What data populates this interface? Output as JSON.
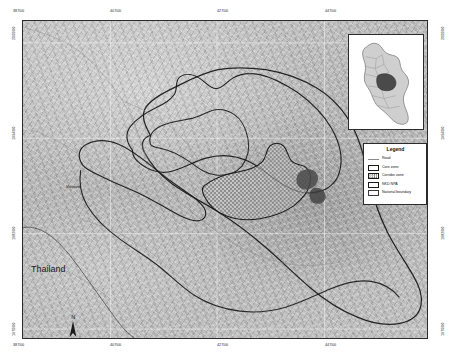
{
  "map": {
    "title": "Nakai-Nam Theun protected area map",
    "country_labels": [
      {
        "name": "thailand",
        "text": "Thailand"
      },
      {
        "name": "vientiane",
        "text": "Vientiane"
      }
    ],
    "north_arrow": {
      "label": "N"
    },
    "scalebar": {
      "ticks": [
        "0",
        "45",
        "9 km"
      ],
      "unit": "km"
    },
    "colors": {
      "terrain_base": "#b8b8b8",
      "frame": "#2b2b2b",
      "boundary_line": "#1a1a1a",
      "road": "#8a8a8a",
      "corridor_fill": "#d8d8d8",
      "inset_land": "#c9c9c9",
      "inset_highlight": "#4a4a4a",
      "graticule": "#e8e8e8"
    },
    "graticule": {
      "top_labels": [
        {
          "value": "387",
          "unit": "000"
        },
        {
          "value": "407",
          "unit": "000"
        },
        {
          "value": "427",
          "unit": "000"
        },
        {
          "value": "447",
          "unit": "000"
        }
      ],
      "bottom_labels": [
        {
          "value": "387",
          "unit": "000"
        },
        {
          "value": "407",
          "unit": "000"
        },
        {
          "value": "427",
          "unit": "000"
        },
        {
          "value": "447",
          "unit": "000"
        }
      ],
      "left_labels": [
        {
          "value": "2000",
          "unit": "000"
        },
        {
          "value": "1994",
          "unit": "000"
        },
        {
          "value": "1982",
          "unit": "000"
        },
        {
          "value": "1970",
          "unit": "000"
        }
      ],
      "right_labels": [
        {
          "value": "2000",
          "unit": "000"
        },
        {
          "value": "1994",
          "unit": "000"
        },
        {
          "value": "1982",
          "unit": "000"
        },
        {
          "value": "1970",
          "unit": "000"
        }
      ]
    }
  },
  "legend": {
    "title": "Legend",
    "items": [
      {
        "name": "road",
        "label": "Road",
        "symbol": "line"
      },
      {
        "name": "core-zone",
        "label": "Core zone",
        "symbol": "box"
      },
      {
        "name": "corridor-zone",
        "label": "Corridor zone",
        "symbol": "hatch"
      },
      {
        "name": "nkd-npa",
        "label": "NKD NPA",
        "symbol": "box"
      },
      {
        "name": "national-boundary",
        "label": "National boundary",
        "symbol": "thin-box"
      }
    ]
  },
  "inset": {
    "name": "laos-locator-map",
    "description": "Country outline with highlighted province"
  }
}
